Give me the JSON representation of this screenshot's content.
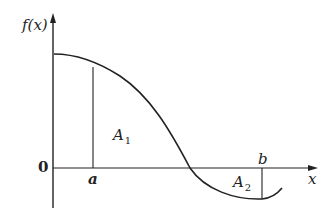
{
  "diagram": {
    "type": "function-graph",
    "y_axis_label": "f(x)",
    "x_axis_label": "x",
    "origin_label": "0",
    "points": [
      {
        "label": "a",
        "description": "left bound, vertical line from x-axis up to curve"
      },
      {
        "label": "b",
        "description": "right bound, vertical line from x-axis down to curve"
      }
    ],
    "regions": [
      {
        "label": "A",
        "subscript": "1",
        "position": "above x-axis, between a and zero crossing"
      },
      {
        "label": "A",
        "subscript": "2",
        "position": "below x-axis, between zero crossing and b"
      }
    ],
    "curve": "decreasing curve starting above x-axis, crossing the x-axis, reaching a minimum near b and rising slightly",
    "colors": {
      "stroke": "#222222",
      "background": "#ffffff"
    }
  }
}
